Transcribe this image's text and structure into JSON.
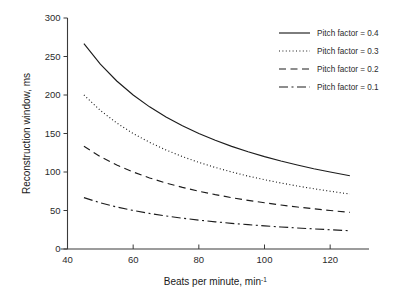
{
  "chart_data": {
    "type": "line",
    "title": "",
    "xlabel": "Beats per minute, min",
    "xlabel_sup": "-1",
    "ylabel": "Reconstruction window, ms",
    "xlim": [
      40,
      130
    ],
    "ylim": [
      0,
      300
    ],
    "xticks": [
      40,
      60,
      80,
      100,
      120
    ],
    "yticks": [
      0,
      50,
      100,
      150,
      200,
      250,
      300
    ],
    "xtick_labels": [
      "40",
      "60",
      "80",
      "100",
      "120"
    ],
    "ytick_labels": [
      "0",
      "50",
      "100",
      "150",
      "200",
      "250",
      "300"
    ],
    "grid": false,
    "legend_position": "top-right",
    "x": [
      45,
      50,
      55,
      60,
      65,
      70,
      75,
      80,
      85,
      90,
      95,
      100,
      105,
      110,
      115,
      120,
      126
    ],
    "series": [
      {
        "name": "Pitch factor = 0.4",
        "dash": "solid",
        "values": [
          266.7,
          240.0,
          218.2,
          200.0,
          184.6,
          171.4,
          160.0,
          150.0,
          141.2,
          133.3,
          126.3,
          120.0,
          114.3,
          109.1,
          104.3,
          100.0,
          95.2
        ]
      },
      {
        "name": "Pitch factor = 0.3",
        "dash": "dotted",
        "values": [
          200.0,
          180.0,
          163.6,
          150.0,
          138.5,
          128.6,
          120.0,
          112.5,
          105.9,
          100.0,
          94.7,
          90.0,
          85.7,
          81.8,
          78.3,
          75.0,
          71.4
        ]
      },
      {
        "name": "Pitch factor = 0.2",
        "dash": "dashed",
        "values": [
          133.3,
          120.0,
          109.1,
          100.0,
          92.3,
          85.7,
          80.0,
          75.0,
          70.6,
          66.7,
          63.2,
          60.0,
          57.1,
          54.5,
          52.2,
          50.0,
          47.6
        ]
      },
      {
        "name": "Pitch factor = 0.1",
        "dash": "dashdot",
        "values": [
          66.7,
          60.0,
          54.5,
          50.0,
          46.2,
          42.9,
          40.0,
          37.5,
          35.3,
          33.3,
          31.6,
          30.0,
          28.6,
          27.3,
          26.1,
          25.0,
          23.8
        ]
      }
    ],
    "colors": {
      "line": "#1c1c1c",
      "axis": "#3a3a3a",
      "text": "#1a1a1a",
      "background": "#ffffff"
    }
  }
}
